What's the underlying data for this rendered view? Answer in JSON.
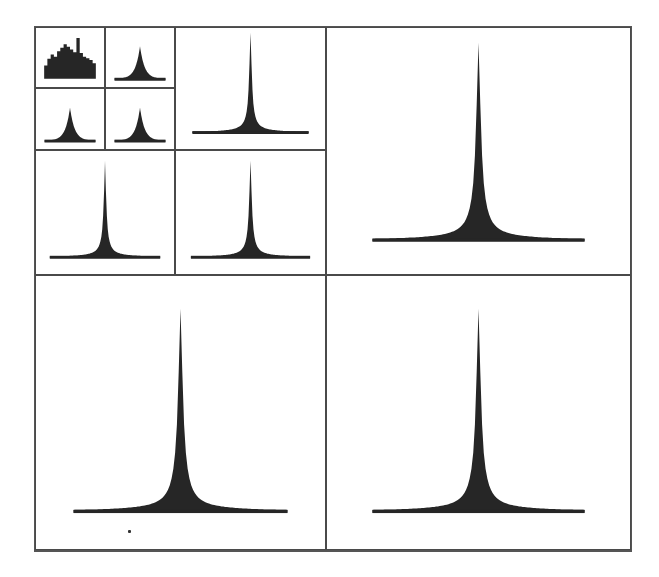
{
  "figure": {
    "ink_color": "#262626",
    "border_color": "#4a4a4a",
    "background": "#ffffff"
  },
  "panels": [
    {
      "id": "level3-a",
      "x": 35,
      "y": 27,
      "w": 70,
      "h": 61,
      "shape": "broad",
      "peak_height": 0.8,
      "width": 0.8
    },
    {
      "id": "level3-b",
      "x": 105,
      "y": 27,
      "w": 70,
      "h": 61,
      "shape": "peak",
      "peak_height": 0.55,
      "width": 0.75
    },
    {
      "id": "level3-c",
      "x": 35,
      "y": 88,
      "w": 70,
      "h": 62,
      "shape": "peak",
      "peak_height": 0.55,
      "width": 0.75
    },
    {
      "id": "level3-d",
      "x": 105,
      "y": 88,
      "w": 70,
      "h": 62,
      "shape": "peak",
      "peak_height": 0.55,
      "width": 0.75
    },
    {
      "id": "level2-b",
      "x": 175,
      "y": 27,
      "w": 151,
      "h": 123,
      "shape": "spike",
      "peak_height": 0.82,
      "width": 0.78
    },
    {
      "id": "level2-c",
      "x": 35,
      "y": 150,
      "w": 140,
      "h": 125,
      "shape": "spike",
      "peak_height": 0.78,
      "width": 0.8
    },
    {
      "id": "level2-d",
      "x": 175,
      "y": 150,
      "w": 151,
      "h": 125,
      "shape": "spike",
      "peak_height": 0.78,
      "width": 0.8
    },
    {
      "id": "level1-b",
      "x": 326,
      "y": 27,
      "w": 305,
      "h": 248,
      "shape": "spike",
      "peak_height": 0.8,
      "width": 0.7
    },
    {
      "id": "level1-c",
      "x": 35,
      "y": 275,
      "w": 291,
      "h": 275,
      "shape": "spike",
      "peak_height": 0.74,
      "width": 0.74
    },
    {
      "id": "level1-d",
      "x": 326,
      "y": 275,
      "w": 305,
      "h": 275,
      "shape": "spike",
      "peak_height": 0.74,
      "width": 0.7
    }
  ],
  "chart_data": {
    "type": "bar",
    "title": "",
    "xlabel": "",
    "ylabel": "",
    "layout": "quad-tree grid of 10 histogram panels (4 at level 3, 3 at level 2, 3 at level 1)",
    "grid": false,
    "legend": "none",
    "series": [
      {
        "name": "level3-a",
        "distribution": "broad multimodal"
      },
      {
        "name": "level3-b",
        "distribution": "peaked, moderate tails"
      },
      {
        "name": "level3-c",
        "distribution": "peaked, moderate tails"
      },
      {
        "name": "level3-d",
        "distribution": "peaked, moderate tails"
      },
      {
        "name": "level2-b",
        "distribution": "sharp spike, long tails"
      },
      {
        "name": "level2-c",
        "distribution": "sharp spike, long tails"
      },
      {
        "name": "level2-d",
        "distribution": "sharp spike, long tails"
      },
      {
        "name": "level1-b",
        "distribution": "very sharp spike, long flat tails"
      },
      {
        "name": "level1-c",
        "distribution": "very sharp spike, long flat tails"
      },
      {
        "name": "level1-d",
        "distribution": "very sharp spike, long flat tails"
      }
    ]
  }
}
